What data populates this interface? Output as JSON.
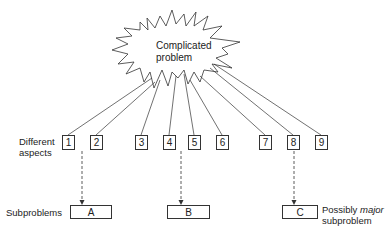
{
  "diagram": {
    "central_node": {
      "label_line1": "Complicated",
      "label_line2": "problem",
      "shape": "starburst-explosion"
    },
    "aspects_label_line1": "Different",
    "aspects_label_line2": "aspects",
    "aspects": [
      {
        "id": "1",
        "label": "1"
      },
      {
        "id": "2",
        "label": "2"
      },
      {
        "id": "3",
        "label": "3"
      },
      {
        "id": "4",
        "label": "4"
      },
      {
        "id": "5",
        "label": "5"
      },
      {
        "id": "6",
        "label": "6"
      },
      {
        "id": "7",
        "label": "7"
      },
      {
        "id": "8",
        "label": "8"
      },
      {
        "id": "9",
        "label": "9"
      }
    ],
    "subproblems_label": "Subproblems",
    "subproblems": [
      {
        "id": "A",
        "label": "A",
        "from_aspect": "1"
      },
      {
        "id": "B",
        "label": "B",
        "from_aspect": "4"
      },
      {
        "id": "C",
        "label": "C",
        "from_aspect": "8"
      }
    ],
    "annotation_c": {
      "prefix": "Possibly ",
      "emphasis": "major",
      "line2": "subproblem"
    },
    "edges": {
      "solid": "central_node -> each aspect",
      "dashed_arrows": [
        "1 -> A",
        "4 -> B",
        "8 -> C"
      ]
    }
  }
}
